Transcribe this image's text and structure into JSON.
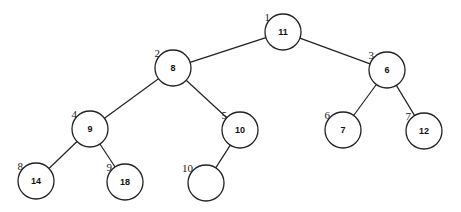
{
  "diagram": {
    "type": "binary-heap-tree",
    "nodes": [
      {
        "index": "1",
        "value": "11",
        "cx": 283,
        "cy": 32
      },
      {
        "index": "2",
        "value": "8",
        "cx": 173,
        "cy": 68
      },
      {
        "index": "3",
        "value": "6",
        "cx": 387,
        "cy": 70
      },
      {
        "index": "4",
        "value": "9",
        "cx": 90,
        "cy": 129
      },
      {
        "index": "5",
        "value": "10",
        "cx": 240,
        "cy": 130
      },
      {
        "index": "6",
        "value": "7",
        "cx": 343,
        "cy": 130
      },
      {
        "index": "7",
        "value": "12",
        "cx": 424,
        "cy": 131
      },
      {
        "index": "8",
        "value": "14",
        "cx": 36,
        "cy": 181
      },
      {
        "index": "9",
        "value": "18",
        "cx": 125,
        "cy": 182
      },
      {
        "index": "10",
        "value": "",
        "cx": 206,
        "cy": 183
      }
    ],
    "edges": [
      [
        0,
        1
      ],
      [
        0,
        2
      ],
      [
        1,
        3
      ],
      [
        1,
        4
      ],
      [
        2,
        5
      ],
      [
        2,
        6
      ],
      [
        3,
        7
      ],
      [
        3,
        8
      ],
      [
        4,
        9
      ]
    ],
    "radius": 18
  }
}
